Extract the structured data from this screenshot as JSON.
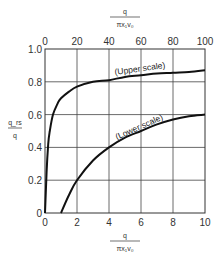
{
  "chart_data": {
    "type": "line",
    "title": "",
    "xlabel_top": {
      "numerator": "q",
      "denominator": "πx₁v₀"
    },
    "xlabel_bottom": {
      "numerator": "q",
      "denominator": "πx₁v₀"
    },
    "ylabel": {
      "numerator": "q_rs",
      "denominator": "q"
    },
    "x_ticks_top": [
      "0",
      "20",
      "40",
      "60",
      "80",
      "100"
    ],
    "x_ticks_bottom": [
      "0",
      "2",
      "4",
      "6",
      "8",
      "10"
    ],
    "y_ticks": [
      "0",
      "0.2",
      "0.4",
      "0.6",
      "0.8",
      "1.0"
    ],
    "xlim_top": [
      0,
      100
    ],
    "xlim_bottom": [
      0,
      10
    ],
    "ylim": [
      0,
      1.0
    ],
    "grid": true,
    "series": [
      {
        "name": "(Upper scale)",
        "axis": "top",
        "x": [
          0,
          1,
          2,
          3,
          5,
          8,
          10,
          15,
          20,
          30,
          40,
          50,
          60,
          70,
          80,
          90,
          100
        ],
        "y": [
          0,
          0.25,
          0.42,
          0.5,
          0.6,
          0.67,
          0.7,
          0.74,
          0.77,
          0.8,
          0.81,
          0.83,
          0.84,
          0.85,
          0.855,
          0.86,
          0.87
        ]
      },
      {
        "name": "(Lower scale)",
        "axis": "bottom",
        "x": [
          1,
          1.5,
          2,
          3,
          4,
          5,
          6,
          7,
          8,
          9,
          10
        ],
        "y": [
          0,
          0.11,
          0.2,
          0.32,
          0.4,
          0.46,
          0.5,
          0.54,
          0.57,
          0.59,
          0.6
        ]
      }
    ]
  },
  "labels": {
    "x_top_num": "q",
    "x_top_den": "πx₁v₀",
    "x_bottom_num": "q",
    "x_bottom_den": "πx₁v₀",
    "y_num": "q_rs",
    "y_den": "q",
    "upper_ann": "(Upper scale)",
    "lower_ann": "(Lower scale)"
  }
}
